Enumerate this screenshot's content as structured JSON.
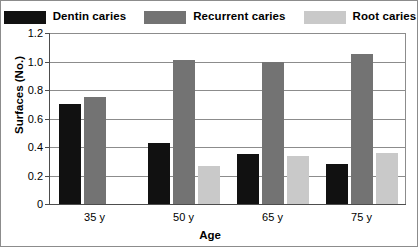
{
  "chart_data": {
    "type": "bar",
    "title": "",
    "subtitle": "",
    "xlabel": "Age",
    "ylabel": "Surfaces (No.)",
    "categories": [
      "35 y",
      "50 y",
      "65 y",
      "75 y"
    ],
    "ylim": [
      0,
      1.2
    ],
    "yticks": [
      "0",
      "0.2",
      "0.4",
      "0.6",
      "0.8",
      "1.0",
      "1.2"
    ],
    "ytick_values": [
      0,
      0.2,
      0.4,
      0.6,
      0.8,
      1.0,
      1.2
    ],
    "grid": "horizontal",
    "legend_position": "top",
    "series": [
      {
        "name": "Dentin caries",
        "color": "#111111",
        "values": [
          0.7,
          0.43,
          0.35,
          0.28
        ]
      },
      {
        "name": "Recurrent caries",
        "color": "#737373",
        "values": [
          0.75,
          1.01,
          1.0,
          1.05
        ]
      },
      {
        "name": "Root caries",
        "color": "#c9c9c9",
        "values": [
          null,
          0.27,
          0.34,
          0.36
        ]
      }
    ]
  },
  "axes": {
    "y_title": "Surfaces (No.)",
    "x_title": "Age"
  },
  "legend": {
    "entries": [
      {
        "label": "Dentin caries",
        "color": "#111111"
      },
      {
        "label": "Recurrent caries",
        "color": "#737373"
      },
      {
        "label": "Root caries",
        "color": "#c9c9c9"
      }
    ]
  }
}
